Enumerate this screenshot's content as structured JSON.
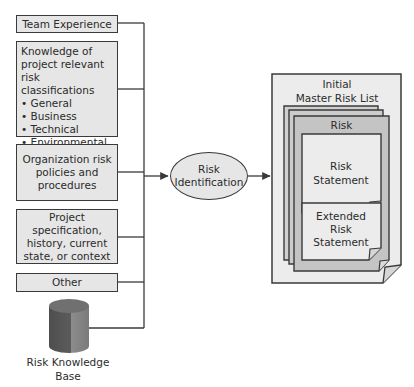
{
  "diagram": {
    "type": "process-flow",
    "inputs": [
      {
        "id": "team-experience",
        "label": "Team Experience"
      },
      {
        "id": "knowledge",
        "title_lines": [
          "Knowledge of",
          "project relevant risk",
          "classifications"
        ],
        "bullets": [
          "General",
          "Business",
          "Technical",
          "Environmental"
        ]
      },
      {
        "id": "organization",
        "lines": [
          "Organization risk",
          "policies and",
          "procedures"
        ]
      },
      {
        "id": "project",
        "lines": [
          "Project",
          "specification,",
          "history, current",
          "state, or context"
        ]
      },
      {
        "id": "other",
        "label": "Other"
      }
    ],
    "database": {
      "id": "risk-knowledge-base",
      "lines": [
        "Risk Knowledge",
        "Base"
      ]
    },
    "process": {
      "lines": [
        "Risk",
        "Identification"
      ]
    },
    "output": {
      "title_lines": [
        "Initial",
        "Master Risk List"
      ],
      "risk_card": {
        "header": "Risk",
        "statement_lines": [
          "Risk",
          "Statement"
        ],
        "extended_lines": [
          "Extended",
          "Risk",
          "Statement"
        ]
      }
    },
    "colors": {
      "box_fill": "#e6e6e6",
      "stroke": "#3a3a3a",
      "risk_page_fill": "#c8c8c8",
      "cylinder_dark": "#5a5a5a",
      "cylinder_light": "#8a8a8a"
    }
  }
}
